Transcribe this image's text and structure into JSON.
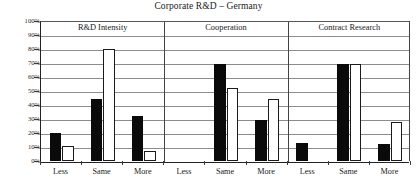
{
  "chart_data": {
    "type": "bar",
    "title": "Corporate R&D – Germany",
    "xlabel": "",
    "ylabel": "",
    "ylim": [
      0,
      100
    ],
    "ytick_labels": [
      "100%",
      "90%",
      "80%",
      "70%",
      "60%",
      "50%",
      "40%",
      "30%",
      "20%",
      "10%",
      "0%"
    ],
    "ytick_values": [
      100,
      90,
      80,
      70,
      60,
      50,
      40,
      30,
      20,
      10,
      0
    ],
    "grid": true,
    "legend": "none",
    "categories": [
      "Less",
      "Same",
      "More",
      "Less",
      "Same",
      "More",
      "Less",
      "Same",
      "More"
    ],
    "groups": [
      {
        "name": "R&D Intensity",
        "categories": [
          "Less",
          "Same",
          "More"
        ],
        "series": [
          {
            "name": "series-1-solid",
            "values": [
              20,
              44,
              32
            ]
          },
          {
            "name": "series-2-hollow",
            "values": [
              11,
              80,
              7
            ]
          }
        ]
      },
      {
        "name": "Cooperation",
        "categories": [
          "Less",
          "Same",
          "More"
        ],
        "series": [
          {
            "name": "series-1-solid",
            "values": [
              0,
              69,
              29
            ]
          },
          {
            "name": "series-2-hollow",
            "values": [
              0,
              52,
              44
            ]
          }
        ]
      },
      {
        "name": "Contract Research",
        "categories": [
          "Less",
          "Same",
          "More"
        ],
        "series": [
          {
            "name": "series-1-solid",
            "values": [
              13,
              69,
              12
            ]
          },
          {
            "name": "series-2-hollow",
            "values": [
              0,
              69,
              28
            ]
          }
        ]
      }
    ],
    "series": [
      {
        "name": "series-1-solid",
        "values": [
          20,
          44,
          32,
          0,
          69,
          29,
          13,
          69,
          12
        ]
      },
      {
        "name": "series-2-hollow",
        "values": [
          11,
          80,
          7,
          0,
          52,
          44,
          0,
          69,
          28
        ]
      }
    ],
    "colors": {
      "series_1": "#0a0a0a",
      "series_2": "#ffffff",
      "axis": "#222222",
      "grid": "#8c8c8c"
    }
  },
  "sections": [
    {
      "label": "R&D Intensity"
    },
    {
      "label": "Cooperation"
    },
    {
      "label": "Contract Research"
    }
  ]
}
